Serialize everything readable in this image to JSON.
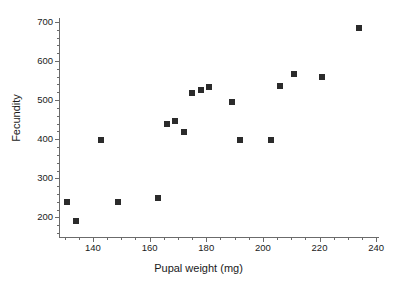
{
  "chart_data": {
    "type": "scatter",
    "title": "",
    "xlabel": "Pupal weight (mg)",
    "ylabel": "Fecundity",
    "xlim": [
      128,
      241
    ],
    "ylim": [
      150,
      710
    ],
    "xticks": [
      140,
      160,
      180,
      200,
      220,
      240
    ],
    "yticks": [
      200,
      300,
      400,
      500,
      600,
      700
    ],
    "x_minor_tick_interval": 5,
    "y_minor_tick_interval": 20,
    "grid": false,
    "legend": "none",
    "marker": {
      "shape": "square",
      "color": "#2b2b2b",
      "size_px": 6
    },
    "points": [
      {
        "x": 131,
        "y": 240
      },
      {
        "x": 134,
        "y": 192
      },
      {
        "x": 143,
        "y": 398
      },
      {
        "x": 149,
        "y": 240
      },
      {
        "x": 163,
        "y": 249
      },
      {
        "x": 166,
        "y": 438
      },
      {
        "x": 169,
        "y": 447
      },
      {
        "x": 172,
        "y": 418
      },
      {
        "x": 175,
        "y": 517
      },
      {
        "x": 178,
        "y": 527
      },
      {
        "x": 181,
        "y": 533
      },
      {
        "x": 189,
        "y": 495
      },
      {
        "x": 192,
        "y": 397
      },
      {
        "x": 203,
        "y": 397
      },
      {
        "x": 206,
        "y": 537
      },
      {
        "x": 211,
        "y": 567
      },
      {
        "x": 221,
        "y": 559
      },
      {
        "x": 234,
        "y": 684
      }
    ]
  },
  "axes": {
    "x_tick_labels": [
      "140",
      "160",
      "180",
      "200",
      "220",
      "240"
    ],
    "y_tick_labels": [
      "200",
      "300",
      "400",
      "500",
      "600",
      "700"
    ],
    "x_title": "Pupal weight (mg)",
    "y_title": "Fecundity"
  }
}
